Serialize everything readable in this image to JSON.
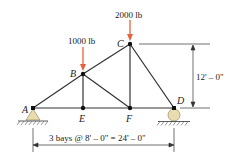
{
  "diagram": {
    "type": "truss",
    "nodes": {
      "A": {
        "label": "A",
        "x": 0,
        "y": 0
      },
      "E": {
        "label": "E",
        "x": 8,
        "y": 0
      },
      "F": {
        "label": "F",
        "x": 16,
        "y": 0
      },
      "D": {
        "label": "D",
        "x": 24,
        "y": 0
      },
      "B": {
        "label": "B",
        "x": 8,
        "y": 6
      },
      "C": {
        "label": "C",
        "x": 16,
        "y": 12
      }
    },
    "members": [
      [
        "A",
        "B"
      ],
      [
        "B",
        "C"
      ],
      [
        "A",
        "E"
      ],
      [
        "E",
        "F"
      ],
      [
        "F",
        "D"
      ],
      [
        "B",
        "E"
      ],
      [
        "B",
        "F"
      ],
      [
        "C",
        "F"
      ],
      [
        "C",
        "D"
      ]
    ],
    "loads": [
      {
        "node": "B",
        "label": "1000 lb"
      },
      {
        "node": "C",
        "label": "2000 lb"
      }
    ],
    "supports": [
      {
        "node": "A",
        "type": "pin"
      },
      {
        "node": "D",
        "type": "roller"
      }
    ],
    "dimensions": {
      "height_label": "12' – 0\"",
      "span_label": "3 bays @ 8' – 0\" = 24' – 0\""
    },
    "colors": {
      "member": "#333333",
      "load_arrow": "#e8603c",
      "support_fill": "#e9ddb0",
      "node": "#111111"
    }
  }
}
